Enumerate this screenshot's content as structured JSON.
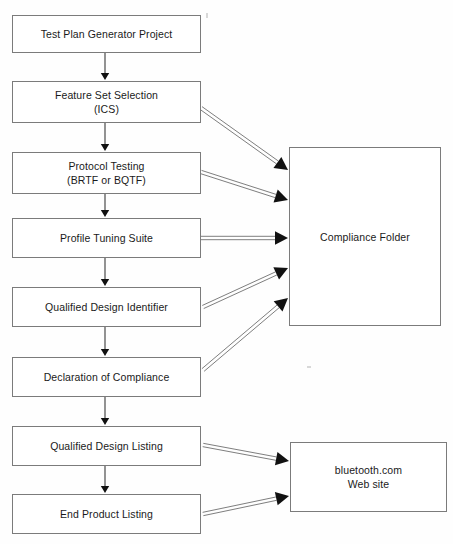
{
  "diagram": {
    "background_color": "#fefefe",
    "box_border_color": "#7b7b7b",
    "text_color": "#1a1a1a",
    "arrow_color": "#3a3a3a",
    "nodes": [
      {
        "id": "test-plan-generator-project",
        "label": "Test Plan Generator Project",
        "x": 12,
        "y": 15,
        "w": 189,
        "h": 38
      },
      {
        "id": "feature-set-selection",
        "label": "Feature Set Selection\n(ICS)",
        "x": 12,
        "y": 81,
        "w": 189,
        "h": 42
      },
      {
        "id": "protocol-testing",
        "label": "Protocol Testing\n(BRTF or BQTF)",
        "x": 12,
        "y": 152,
        "w": 189,
        "h": 42
      },
      {
        "id": "profile-tuning-suite",
        "label": "Profile Tuning Suite",
        "x": 12,
        "y": 218,
        "w": 189,
        "h": 40
      },
      {
        "id": "qualified-design-identifier",
        "label": "Qualified Design Identifier",
        "x": 12,
        "y": 287,
        "w": 189,
        "h": 40
      },
      {
        "id": "declaration-of-compliance",
        "label": "Declaration of Compliance",
        "x": 12,
        "y": 357,
        "w": 189,
        "h": 40
      },
      {
        "id": "qualified-design-listing",
        "label": "Qualified Design Listing",
        "x": 12,
        "y": 426,
        "w": 189,
        "h": 40
      },
      {
        "id": "end-product-listing",
        "label": "End Product Listing",
        "x": 12,
        "y": 494,
        "w": 189,
        "h": 40
      },
      {
        "id": "compliance-folder",
        "label": "Compliance Folder",
        "x": 289,
        "y": 147,
        "w": 152,
        "h": 179
      },
      {
        "id": "bluetooth-com-web-site",
        "label": "bluetooth.com\nWeb site",
        "x": 290,
        "y": 442,
        "w": 157,
        "h": 70
      }
    ],
    "edges": [
      {
        "id": "edge-test-plan-to-feature-set",
        "from": "test-plan-generator-project",
        "to": "feature-set-selection",
        "style": "thin",
        "x1": 105,
        "y1": 53,
        "x2": 105,
        "y2": 80
      },
      {
        "id": "edge-feature-set-to-protocol-testing",
        "from": "feature-set-selection",
        "to": "protocol-testing",
        "style": "thin",
        "x1": 105,
        "y1": 123,
        "x2": 105,
        "y2": 151
      },
      {
        "id": "edge-protocol-testing-to-profile-tuning",
        "from": "protocol-testing",
        "to": "profile-tuning-suite",
        "style": "thin",
        "x1": 105,
        "y1": 194,
        "x2": 105,
        "y2": 217
      },
      {
        "id": "edge-profile-tuning-to-qualified-design-identifier",
        "from": "profile-tuning-suite",
        "to": "qualified-design-identifier",
        "style": "thin",
        "x1": 105,
        "y1": 258,
        "x2": 105,
        "y2": 286
      },
      {
        "id": "edge-qualified-design-identifier-to-declaration",
        "from": "qualified-design-identifier",
        "to": "declaration-of-compliance",
        "style": "thin",
        "x1": 105,
        "y1": 327,
        "x2": 105,
        "y2": 356
      },
      {
        "id": "edge-declaration-to-qualified-design-listing",
        "from": "declaration-of-compliance",
        "to": "qualified-design-listing",
        "style": "thin",
        "x1": 105,
        "y1": 397,
        "x2": 105,
        "y2": 425
      },
      {
        "id": "edge-qualified-design-listing-to-end-product-listing",
        "from": "qualified-design-listing",
        "to": "end-product-listing",
        "style": "thin",
        "x1": 105,
        "y1": 466,
        "x2": 105,
        "y2": 493
      },
      {
        "id": "edge-feature-set-to-compliance-folder",
        "from": "feature-set-selection",
        "to": "compliance-folder",
        "style": "open",
        "x1": 201,
        "y1": 108,
        "x2": 288,
        "y2": 170
      },
      {
        "id": "edge-protocol-testing-to-compliance-folder",
        "from": "protocol-testing",
        "to": "compliance-folder",
        "style": "open",
        "x1": 201,
        "y1": 172,
        "x2": 288,
        "y2": 200
      },
      {
        "id": "edge-profile-tuning-to-compliance-folder",
        "from": "profile-tuning-suite",
        "to": "compliance-folder",
        "style": "open",
        "x1": 201,
        "y1": 238,
        "x2": 288,
        "y2": 238
      },
      {
        "id": "edge-qualified-design-identifier-to-compliance-folder",
        "from": "qualified-design-identifier",
        "to": "compliance-folder",
        "style": "open",
        "x1": 203,
        "y1": 307,
        "x2": 288,
        "y2": 268
      },
      {
        "id": "edge-declaration-to-compliance-folder",
        "from": "declaration-of-compliance",
        "to": "compliance-folder",
        "style": "open",
        "x1": 203,
        "y1": 370,
        "x2": 288,
        "y2": 298
      },
      {
        "id": "edge-qualified-design-listing-to-website",
        "from": "qualified-design-listing",
        "to": "bluetooth-com-web-site",
        "style": "open",
        "x1": 203,
        "y1": 445,
        "x2": 289,
        "y2": 461
      },
      {
        "id": "edge-end-product-listing-to-website",
        "from": "end-product-listing",
        "to": "bluetooth-com-web-site",
        "style": "open",
        "x1": 203,
        "y1": 514,
        "x2": 289,
        "y2": 496
      }
    ]
  }
}
